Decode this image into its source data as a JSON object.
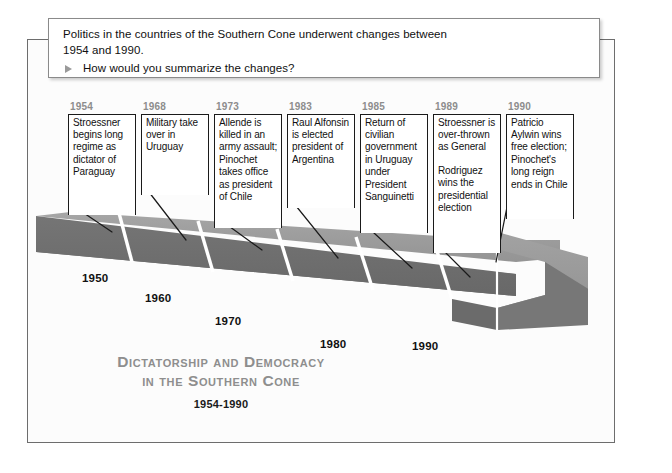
{
  "prompt": {
    "line1": "Politics in the countries of the Southern Cone underwent changes between",
    "line2": "1954 and 1990.",
    "question": "How would you summarize the changes?",
    "bullet_icon": "triangle-right-icon"
  },
  "title": {
    "main_line1": "Dictatorship and Democracy",
    "main_line2": "in the Southern Cone",
    "dates": "1954-1990"
  },
  "events": [
    {
      "year": "1954",
      "paragraphs": [
        "Stroessner begins long regime as dictator of Paraguay"
      ]
    },
    {
      "year": "1968",
      "paragraphs": [
        "Military take over in Uruguay"
      ]
    },
    {
      "year": "1973",
      "paragraphs": [
        "Allende is killed in an army assault; Pinochet takes office as president of Chile"
      ]
    },
    {
      "year": "1983",
      "paragraphs": [
        "Raul Alfonsin is elected president of Argentina"
      ]
    },
    {
      "year": "1985",
      "paragraphs": [
        "Return of civilian government in Uruguay under President Sanguinetti"
      ]
    },
    {
      "year": "1989",
      "paragraphs": [
        "Stroessner is over-thrown as General",
        "Rodriguez wins the presidential election"
      ]
    },
    {
      "year": "1990",
      "paragraphs": [
        "Patricio Aylwin wins free election; Pinochet's long reign ends in Chile"
      ]
    }
  ],
  "decades": [
    {
      "label": "1950"
    },
    {
      "label": "1960"
    },
    {
      "label": "1970"
    },
    {
      "label": "1980"
    },
    {
      "label": "1990"
    }
  ],
  "colors": {
    "year_gray": "#8d8d8d",
    "title_gray": "#8e8e8e",
    "road_top": "#9b9b9b",
    "road_face": "#6e6e6e",
    "frame_border": "#6d6d6d"
  }
}
